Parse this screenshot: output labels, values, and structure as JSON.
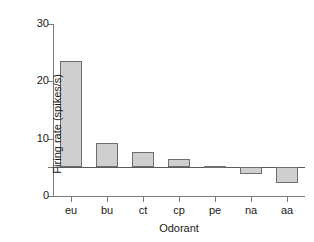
{
  "chart_data": {
    "type": "bar",
    "title": "",
    "subtitle": "",
    "xlabel": "Odorant",
    "ylabel": "Firing rate (spikes/s)",
    "categories": [
      "eu",
      "bu",
      "ct",
      "cp",
      "pe",
      "na",
      "aa"
    ],
    "values": [
      23.5,
      9.2,
      7.6,
      6.5,
      5.2,
      3.8,
      2.3
    ],
    "baseline": 5.0,
    "ylim": [
      0,
      30
    ],
    "yticks": [
      0,
      10,
      20,
      30
    ],
    "ytick_labels": [
      "0",
      "10",
      "20",
      "30"
    ],
    "xticks": [
      "eu",
      "bu",
      "ct",
      "cp",
      "pe",
      "na",
      "aa"
    ],
    "grid": false,
    "legend": null,
    "annotations": [],
    "bar_fill_color": "#cfcfcf",
    "bar_edge_color": "#6e6e6e",
    "axis_color": "#7b7b7b",
    "text_color": "#1a1a1a",
    "background_color": "#ffffff"
  }
}
